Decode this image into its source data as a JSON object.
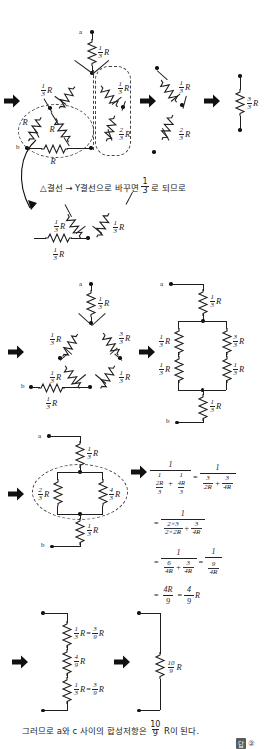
{
  "page": {
    "width": 274,
    "height": 749
  },
  "labels": {
    "node_a": "a",
    "node_b": "b",
    "R": "R",
    "one_third_R": "1/3 R",
    "two_third_R": "2/3 R",
    "three_third_R": "3/3 R",
    "four_third_R": "4/3 R",
    "three_ninth_R": "3/9 R",
    "four_ninth_R": "4/9 R",
    "ten_ninth_R": "10/9 R"
  },
  "fractions": {
    "one_three": {
      "num": "1",
      "den": "3"
    },
    "two_three": {
      "num": "2",
      "den": "3"
    },
    "three_three": {
      "num": "3",
      "den": "3"
    },
    "four_three": {
      "num": "4",
      "den": "3"
    },
    "three_nine": {
      "num": "3",
      "den": "9"
    },
    "four_nine": {
      "num": "4",
      "den": "9"
    },
    "ten_nine": {
      "num": "10",
      "den": "9"
    }
  },
  "captions": {
    "delta_to_y": "△결선 → Y결선으로 바꾸면",
    "delta_to_y_tail": "로 되므로",
    "delta_to_y_frac": {
      "num": "1",
      "den": "3"
    },
    "conclusion_pre": "그러므로 a와 c 사이의 합성저항은",
    "conclusion_frac": {
      "num": "10",
      "den": "9"
    },
    "conclusion_post": "R이 된다."
  },
  "answer": {
    "label": "답",
    "value": "②"
  },
  "math": {
    "line1": {
      "lhs_num": "1",
      "lhs_den_a": {
        "num": "1",
        "den_num": "2R",
        "den_den": "3"
      },
      "op": "+",
      "lhs_den_b": {
        "num": "1",
        "den_num": "4R",
        "den_den": "3"
      },
      "equals": "=",
      "rhs_num": "1",
      "rhs_den_a": {
        "num": "3",
        "den": "2R"
      },
      "rhs_den_b": {
        "num": "3",
        "den": "4R"
      }
    },
    "line2": {
      "equals": "=",
      "num": "1",
      "den_a": {
        "num": "2×3",
        "den": "2×2R"
      },
      "op": "+",
      "den_b": {
        "num": "3",
        "den": "4R"
      }
    },
    "line3": {
      "equals": "=",
      "num": "1",
      "den_a": {
        "num": "6",
        "den": "4R"
      },
      "op": "+",
      "den_b": {
        "num": "3",
        "den": "4R"
      },
      "equals2": "=",
      "result": {
        "num": "1",
        "den_num": "9",
        "den_den": "4R"
      }
    },
    "line4": {
      "equals": "=",
      "first": {
        "num": "4R",
        "den": "9"
      },
      "equals2": "=",
      "second": {
        "num": "4",
        "den": "9"
      },
      "unit": "R"
    }
  },
  "steps": [
    {
      "id": "step1-delta-network",
      "name": "원회로 (△결선 포함)",
      "resistors": [
        "1/3 R",
        "1/3 R",
        "1/3 R",
        "R",
        "R",
        "R",
        "2/3 R"
      ]
    },
    {
      "id": "step1-series",
      "name": "직렬 등가",
      "resistors": [
        "1/3 R",
        "2/3 R"
      ]
    },
    {
      "id": "step1-total",
      "name": "합성",
      "resistors": [
        "3/3 R"
      ]
    },
    {
      "id": "step2-y-network",
      "name": "Y결선 등가",
      "resistors": [
        "1/3 R",
        "1/3 R",
        "1/3 R"
      ]
    },
    {
      "id": "step3-bridge",
      "name": "마름모 회로",
      "resistors": [
        "1/3 R",
        "1/3 R",
        "3/3 R",
        "1/3 R",
        "1/3 R",
        "1/3 R"
      ]
    },
    {
      "id": "step3-ladder",
      "name": "사다리 회로",
      "resistors": [
        "1/3 R",
        "1/3 R",
        "3/3 R",
        "1/3 R",
        "1/3 R",
        "1/3 R"
      ]
    },
    {
      "id": "step4-parallel",
      "name": "병렬부 정리",
      "resistors": [
        "1/3 R",
        "2/3 R",
        "4/3 R",
        "1/3 R"
      ]
    },
    {
      "id": "step5-series3",
      "name": "직렬 3개",
      "resistors": [
        "1/3 R = 3/9 R",
        "4/9 R",
        "1/3 R = 3/9 R"
      ]
    },
    {
      "id": "step5-final",
      "name": "최종 합성저항",
      "resistors": [
        "10/9 R"
      ]
    }
  ],
  "colors": {
    "ink": "#1f1f1f",
    "dashed": "#444444",
    "background": "#ffffff"
  }
}
